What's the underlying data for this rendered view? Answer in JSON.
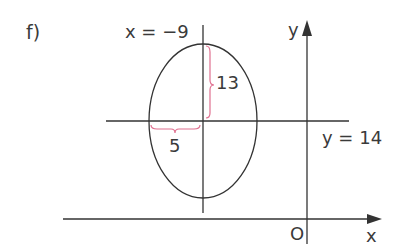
{
  "problem_label": "f)",
  "labels": {
    "vertical_line": "x = −9",
    "horizontal_line": "y = 14",
    "y_axis": "y",
    "x_axis": "x",
    "origin": "O",
    "semi_major": "13",
    "semi_minor": "5"
  },
  "ellipse": {
    "center": [
      -9,
      14
    ],
    "semi_axis_vertical": 13,
    "semi_axis_horizontal": 5
  },
  "colors": {
    "line": "#333333",
    "brace": "#e07090",
    "text": "#3a3a3a"
  }
}
